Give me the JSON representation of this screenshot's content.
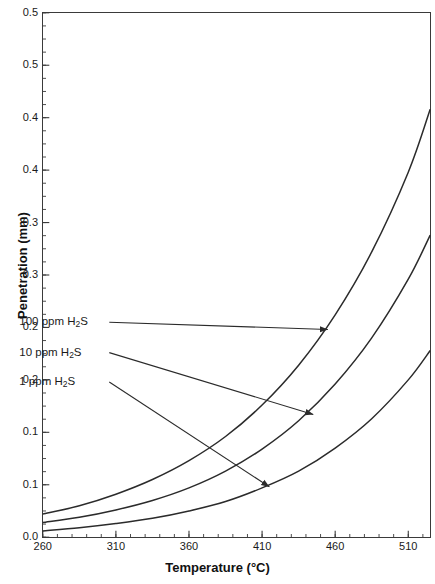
{
  "chart_data": {
    "type": "line",
    "title": "",
    "xlabel": "Temperature (°C)",
    "ylabel": "Penetration (mm)",
    "xlim": [
      260,
      525
    ],
    "ylim": [
      0.0,
      0.5
    ],
    "grid": false,
    "legend_position": "inline-annotations",
    "x_ticks": [
      260,
      310,
      360,
      410,
      460,
      510
    ],
    "x_tick_labels": [
      "260",
      "310",
      "360",
      "410",
      "460",
      "510"
    ],
    "x_minor_tick_step": 10,
    "y_ticks": [
      0.0,
      0.05,
      0.1,
      0.15,
      0.2,
      0.25,
      0.3,
      0.35,
      0.4,
      0.45,
      0.5
    ],
    "y_tick_labels": [
      "0.0",
      "0.1",
      "0.1",
      "0.2",
      "0.2",
      "0.3",
      "0.3",
      "0.4",
      "0.4",
      "0.5",
      "0.5"
    ],
    "y_minor_tick_step": 0.0125,
    "series": [
      {
        "name": "100 ppm H2S",
        "label": "100 ppm H",
        "label_sub": "2",
        "label_tail": "S",
        "x": [
          260,
          285,
          310,
          335,
          360,
          385,
          410,
          435,
          460,
          485,
          510,
          525
        ],
        "values": [
          0.022,
          0.03,
          0.041,
          0.055,
          0.073,
          0.096,
          0.126,
          0.164,
          0.212,
          0.272,
          0.348,
          0.408
        ]
      },
      {
        "name": "10 ppm H2S",
        "label": "10 ppm H",
        "label_sub": "2",
        "label_tail": "S",
        "x": [
          260,
          285,
          310,
          335,
          360,
          385,
          410,
          435,
          460,
          485,
          510,
          525
        ],
        "values": [
          0.014,
          0.019,
          0.026,
          0.035,
          0.047,
          0.063,
          0.084,
          0.111,
          0.146,
          0.19,
          0.246,
          0.288
        ]
      },
      {
        "name": "1 ppm H2S",
        "label": "1 ppm H",
        "label_sub": "2",
        "label_tail": "S",
        "x": [
          260,
          285,
          310,
          335,
          360,
          385,
          410,
          435,
          460,
          485,
          510,
          525
        ],
        "values": [
          0.006,
          0.009,
          0.013,
          0.018,
          0.025,
          0.034,
          0.047,
          0.063,
          0.085,
          0.113,
          0.15,
          0.178
        ]
      }
    ],
    "annotations": [
      {
        "text": "100 ppm H2S",
        "target_series": "100 ppm H2S",
        "text_x": 300,
        "text_y": 0.205,
        "arrow_to_x": 455,
        "arrow_to_y": 0.198
      },
      {
        "text": "10 ppm H2S",
        "target_series": "10 ppm H2S",
        "text_x": 300,
        "text_y": 0.176,
        "arrow_to_x": 445,
        "arrow_to_y": 0.117
      },
      {
        "text": "1 ppm H2S",
        "target_series": "1 ppm H2S",
        "text_x": 300,
        "text_y": 0.148,
        "arrow_to_x": 415,
        "arrow_to_y": 0.048
      }
    ],
    "colors": {
      "line": "#2b2b2b",
      "axis": "#3a3a3a",
      "background": "#ffffff"
    }
  }
}
